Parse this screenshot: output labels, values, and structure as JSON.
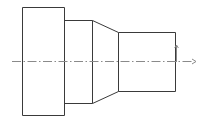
{
  "drawing": {
    "title": "Stepped Shaft Reducer Elevation",
    "view_type": "elevation",
    "background_color": "#ffffff",
    "line_color": "#3a3a3a",
    "centerline_color": "#8a8a8a",
    "line_width": 1,
    "canvas": {
      "width": 203,
      "height": 123
    },
    "profile_label": "stepped-bushing-profile",
    "parts": [
      {
        "name": "large-flange-section",
        "shape": "rectangle",
        "x1": 22,
        "y1": 7,
        "x2": 64,
        "y2": 115
      },
      {
        "name": "intermediate-section",
        "shape": "rectangle",
        "x1": 64,
        "y1": 20,
        "x2": 92,
        "y2": 103
      },
      {
        "name": "tapered-cone-section",
        "shape": "taper",
        "x1": 92,
        "y1_top": 20,
        "y1_bottom": 103,
        "x2": 118,
        "y2_top": 32,
        "y2_bottom": 91
      },
      {
        "name": "small-nose-section",
        "shape": "rectangle",
        "x1": 118,
        "y1": 32,
        "x2": 175,
        "y2": 91
      }
    ],
    "centerline": {
      "name": "horizontal-axis-centerline",
      "y": 61,
      "x_start": 12,
      "x_end": 194,
      "dash_pattern": "9 2.5 1.5 2.5",
      "arrow_x": 196,
      "arrow_size": 4
    },
    "axis_marker": {
      "name": "vertical-axis-tick",
      "x": 176,
      "y_top": 45,
      "y_bottom": 62,
      "arrow_size": 3
    }
  }
}
